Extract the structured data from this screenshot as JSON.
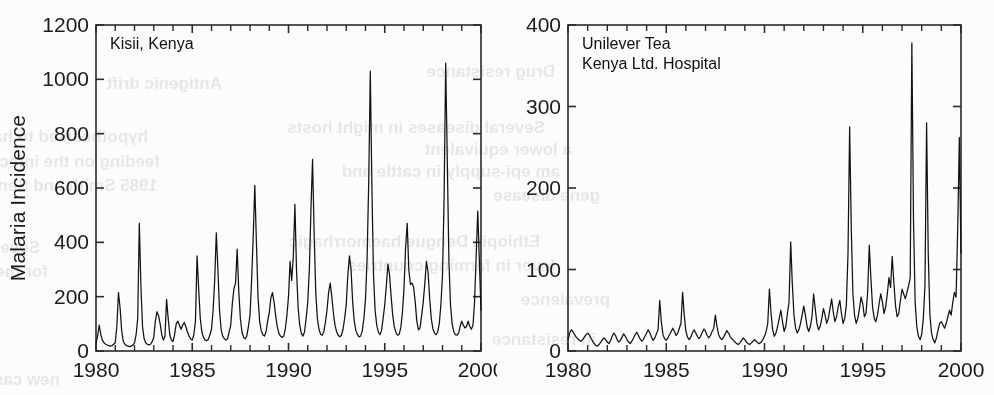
{
  "figure": {
    "background_color": "#fcfcfc",
    "ink_color": "#121212",
    "ylabel": "Malaria Incidence"
  },
  "bleed_through": {
    "note": "faint mirrored show-through text from the reverse page of the scan",
    "lines": [
      {
        "text": "Antigenic drift",
        "x": 222,
        "y": 74,
        "size": 17
      },
      {
        "text": "Drug resistance",
        "x": 555,
        "y": 62,
        "size": 17
      },
      {
        "text": "hypothesised to have originated",
        "x": 148,
        "y": 127,
        "size": 17
      },
      {
        "text": "Several diseases in might hosts",
        "x": 545,
        "y": 118,
        "size": 17
      },
      {
        "text": "feeding on the infected areas",
        "x": 160,
        "y": 152,
        "size": 17
      },
      {
        "text": "a lower equivalent",
        "x": 572,
        "y": 140,
        "size": 17
      },
      {
        "text": "1985 Smith and Sendov 1986",
        "x": 158,
        "y": 176,
        "size": 17
      },
      {
        "text": "am epi-supply in cattle and",
        "x": 560,
        "y": 162,
        "size": 17
      },
      {
        "text": "gene disease",
        "x": 600,
        "y": 186,
        "size": 17
      },
      {
        "text": "Several seasonal populations and",
        "x": 40,
        "y": 238,
        "size": 17
      },
      {
        "text": "Ethiopia Dengue haemorrhagic",
        "x": 540,
        "y": 232,
        "size": 17
      },
      {
        "text": "for the aerosolized human liquid",
        "x": 48,
        "y": 262,
        "size": 17
      },
      {
        "text": "fever in farming countries",
        "x": 556,
        "y": 256,
        "size": 17
      },
      {
        "text": "prevalence",
        "x": 610,
        "y": 290,
        "size": 17
      },
      {
        "text": "new cases to children a healthy surveys",
        "x": 60,
        "y": 370,
        "size": 17
      },
      {
        "text": "in resistance",
        "x": 596,
        "y": 330,
        "size": 17
      }
    ]
  },
  "charts": [
    {
      "id": "kisii-kenya",
      "annotation": "Kisii, Kenya",
      "annotation_lines": [
        "Kisii, Kenya"
      ],
      "ylabel": "Malaria Incidence",
      "xlabel": "",
      "x_ticks": [
        1980,
        1985,
        1990,
        1995,
        2000
      ],
      "x_tick_labels": [
        "1980",
        "1985",
        "1990",
        "1995",
        "2000"
      ],
      "y_ticks": [
        0,
        200,
        400,
        600,
        800,
        1000,
        1200
      ],
      "y_tick_labels": [
        "0",
        "200",
        "400",
        "600",
        "800",
        "1000",
        "1200"
      ],
      "xlim": [
        1980,
        2000
      ],
      "ylim": [
        0,
        1200
      ],
      "minor_x_tick_step": 1
    },
    {
      "id": "unilever-tea-kenya",
      "annotation": "Unilever Tea Kenya Ltd. Hospital",
      "annotation_lines": [
        "Unilever Tea",
        "Kenya Ltd. Hospital"
      ],
      "ylabel": "",
      "xlabel": "",
      "x_ticks": [
        1980,
        1985,
        1990,
        1995,
        2000
      ],
      "x_tick_labels": [
        "1980",
        "1985",
        "1990",
        "1995",
        "2000"
      ],
      "y_ticks": [
        0,
        100,
        200,
        300,
        400
      ],
      "y_tick_labels": [
        "0",
        "100",
        "200",
        "300",
        "400"
      ],
      "xlim": [
        1980,
        2000
      ],
      "ylim": [
        0,
        400
      ],
      "minor_x_tick_step": 1
    }
  ],
  "chart_data": [
    {
      "type": "line",
      "title": "Kisii, Kenya",
      "xlabel": "",
      "ylabel": "Malaria Incidence",
      "xlim": [
        1980,
        2000
      ],
      "ylim": [
        0,
        1200
      ],
      "grid": false,
      "legend": "none",
      "x_unit": "year (monthly samples)",
      "series": [
        {
          "name": "Malaria incidence, Kisii, Kenya",
          "x_start": 1980.0,
          "x_step": 0.08333,
          "values": [
            30,
            55,
            95,
            60,
            40,
            30,
            25,
            22,
            20,
            18,
            20,
            25,
            30,
            90,
            215,
            160,
            75,
            35,
            25,
            20,
            18,
            16,
            18,
            22,
            30,
            60,
            120,
            470,
            240,
            90,
            45,
            30,
            25,
            22,
            25,
            35,
            50,
            110,
            145,
            130,
            100,
            60,
            40,
            55,
            190,
            120,
            60,
            40,
            35,
            60,
            100,
            110,
            95,
            80,
            95,
            105,
            90,
            70,
            55,
            45,
            40,
            60,
            110,
            350,
            230,
            120,
            70,
            50,
            40,
            38,
            42,
            60,
            80,
            150,
            260,
            435,
            300,
            150,
            80,
            55,
            45,
            40,
            45,
            70,
            95,
            175,
            230,
            250,
            375,
            220,
            120,
            70,
            50,
            45,
            55,
            90,
            130,
            260,
            420,
            610,
            400,
            200,
            110,
            75,
            60,
            55,
            70,
            110,
            140,
            195,
            215,
            180,
            130,
            90,
            65,
            55,
            50,
            55,
            80,
            130,
            200,
            330,
            260,
            345,
            540,
            300,
            160,
            95,
            65,
            55,
            70,
            120,
            180,
            300,
            520,
            705,
            430,
            215,
            120,
            80,
            62,
            58,
            70,
            105,
            150,
            215,
            250,
            200,
            140,
            95,
            70,
            58,
            52,
            58,
            80,
            120,
            170,
            280,
            350,
            300,
            180,
            110,
            75,
            60,
            52,
            55,
            75,
            120,
            190,
            340,
            620,
            1030,
            600,
            280,
            150,
            95,
            70,
            60,
            75,
            120,
            170,
            240,
            320,
            280,
            200,
            130,
            88,
            68,
            58,
            62,
            85,
            140,
            230,
            380,
            470,
            300,
            245,
            250,
            235,
            180,
            110,
            78,
            85,
            130,
            180,
            250,
            330,
            290,
            195,
            120,
            82,
            66,
            60,
            70,
            100,
            170,
            280,
            560,
            1060,
            700,
            330,
            170,
            100,
            72,
            60,
            58,
            65,
            90,
            110,
            95,
            85,
            90,
            110,
            90,
            80,
            95,
            180,
            350,
            515,
            330,
            150
          ]
        }
      ]
    },
    {
      "type": "line",
      "title": "Unilever Tea Kenya Ltd. Hospital",
      "xlabel": "",
      "ylabel": "",
      "xlim": [
        1980,
        2000
      ],
      "ylim": [
        0,
        400
      ],
      "grid": false,
      "legend": "none",
      "x_unit": "year (monthly samples)",
      "series": [
        {
          "name": "Malaria incidence, Unilever Tea Kenya Ltd. Hospital",
          "x_start": 1980.0,
          "x_step": 0.08333,
          "values": [
            14,
            22,
            26,
            24,
            20,
            17,
            15,
            13,
            12,
            14,
            17,
            20,
            22,
            20,
            16,
            12,
            9,
            7,
            6,
            8,
            11,
            14,
            16,
            14,
            11,
            9,
            13,
            18,
            22,
            19,
            14,
            11,
            13,
            17,
            21,
            18,
            14,
            11,
            9,
            12,
            16,
            20,
            23,
            19,
            15,
            12,
            14,
            18,
            22,
            26,
            22,
            17,
            13,
            16,
            21,
            26,
            62,
            36,
            20,
            15,
            13,
            16,
            20,
            24,
            28,
            24,
            19,
            22,
            28,
            34,
            72,
            44,
            24,
            17,
            14,
            17,
            22,
            26,
            22,
            18,
            15,
            18,
            23,
            27,
            24,
            19,
            16,
            19,
            24,
            28,
            44,
            30,
            20,
            16,
            14,
            17,
            21,
            25,
            22,
            18,
            15,
            13,
            11,
            9,
            8,
            10,
            13,
            16,
            14,
            11,
            9,
            8,
            10,
            12,
            14,
            12,
            10,
            9,
            11,
            14,
            18,
            24,
            34,
            76,
            46,
            26,
            18,
            22,
            30,
            40,
            50,
            36,
            24,
            30,
            46,
            60,
            134,
            82,
            44,
            28,
            22,
            26,
            34,
            44,
            55,
            44,
            30,
            24,
            30,
            42,
            70,
            52,
            34,
            26,
            30,
            40,
            52,
            44,
            34,
            40,
            52,
            64,
            48,
            36,
            42,
            54,
            62,
            46,
            34,
            40,
            56,
            120,
            275,
            150,
            70,
            44,
            34,
            40,
            52,
            66,
            58,
            42,
            46,
            72,
            130,
            88,
            54,
            40,
            36,
            44,
            58,
            70,
            60,
            46,
            54,
            70,
            90,
            78,
            116,
            84,
            56,
            42,
            46,
            62,
            76,
            70,
            64,
            72,
            80,
            90,
            378,
            160,
            60,
            30,
            18,
            14,
            20,
            40,
            80,
            280,
            120,
            45,
            22,
            14,
            10,
            16,
            26,
            34,
            36,
            32,
            28,
            34,
            42,
            50,
            44,
            60,
            72,
            66,
            150,
            262,
            120
          ]
        }
      ]
    }
  ]
}
